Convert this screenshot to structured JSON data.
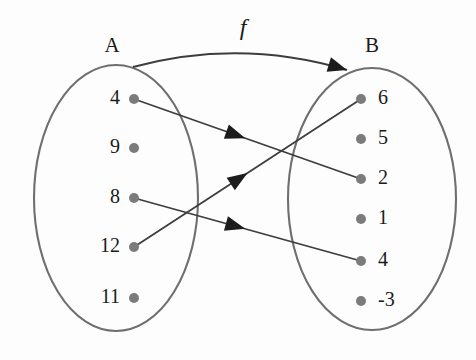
{
  "diagram": {
    "type": "function-mapping-venn",
    "function_label": "f",
    "background_color": "#fdfdfd",
    "oval_stroke_color": "#6f6f6f",
    "dot_color": "#7b7b7b",
    "arrow_color": "#3d3d3d",
    "domain": {
      "name": "A",
      "label_x": 112,
      "label_y": 52,
      "oval": {
        "cx": 116,
        "cy": 198,
        "rx": 82,
        "ry": 133
      },
      "elements": [
        {
          "value": "4",
          "dot_x": 134,
          "dot_y": 99,
          "label_x": 120,
          "label_y": 99
        },
        {
          "value": "9",
          "dot_x": 134,
          "dot_y": 148,
          "label_x": 120,
          "label_y": 148
        },
        {
          "value": "8",
          "dot_x": 134,
          "dot_y": 198,
          "label_x": 120,
          "label_y": 198
        },
        {
          "value": "12",
          "dot_x": 134,
          "dot_y": 247,
          "label_x": 120,
          "label_y": 247
        },
        {
          "value": "11",
          "dot_x": 134,
          "dot_y": 298,
          "label_x": 120,
          "label_y": 298
        }
      ]
    },
    "codomain": {
      "name": "B",
      "label_x": 372,
      "label_y": 52,
      "oval": {
        "cx": 372,
        "cy": 199,
        "rx": 84,
        "ry": 131
      },
      "elements": [
        {
          "value": "6",
          "dot_x": 361,
          "dot_y": 99,
          "label_x": 378,
          "label_y": 99
        },
        {
          "value": "5",
          "dot_x": 361,
          "dot_y": 139,
          "label_x": 378,
          "label_y": 139
        },
        {
          "value": "2",
          "dot_x": 361,
          "dot_y": 179,
          "label_x": 378,
          "label_y": 179
        },
        {
          "value": "1",
          "dot_x": 361,
          "dot_y": 219,
          "label_x": 378,
          "label_y": 219
        },
        {
          "value": "4",
          "dot_x": 361,
          "dot_y": 261,
          "label_x": 378,
          "label_y": 261
        },
        {
          "value": "-3",
          "dot_x": 361,
          "dot_y": 301,
          "label_x": 378,
          "label_y": 301
        }
      ]
    },
    "mappings": [
      {
        "from": "4",
        "to": "2",
        "x1": 134,
        "y1": 99,
        "x2": 361,
        "y2": 179,
        "arrow_t": 0.49
      },
      {
        "from": "8",
        "to": "4",
        "x1": 134,
        "y1": 198,
        "x2": 361,
        "y2": 261,
        "arrow_t": 0.49
      },
      {
        "from": "12",
        "to": "6",
        "x1": 134,
        "y1": 247,
        "x2": 361,
        "y2": 99,
        "arrow_t": 0.5
      }
    ],
    "function_arc": {
      "label": "f",
      "label_x": 243,
      "label_y": 35,
      "start_x": 133,
      "start_y": 67,
      "ctrl_x": 240,
      "ctrl_y": 38,
      "end_x": 347,
      "end_y": 70
    }
  }
}
